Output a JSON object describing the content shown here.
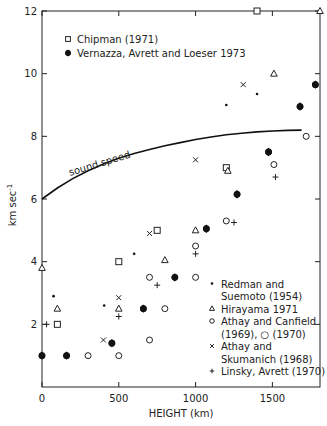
{
  "chart_data": {
    "type": "scatter",
    "title": "",
    "xlabel": "HEIGHT (km)",
    "ylabel": "km sec⁻¹",
    "xlim": [
      0,
      1810
    ],
    "ylim": [
      0,
      12
    ],
    "x_ticks": [
      0,
      500,
      1000,
      1500
    ],
    "y_ticks": [
      2,
      4,
      6,
      8,
      10,
      12
    ],
    "grid": false,
    "legend_position": "top-left and bottom-right (two groups)",
    "line_series": [
      {
        "name": "sound speed",
        "label": "sound speed",
        "points": [
          [
            0,
            6.0
          ],
          [
            100,
            6.35
          ],
          [
            200,
            6.65
          ],
          [
            300,
            6.9
          ],
          [
            400,
            7.12
          ],
          [
            500,
            7.3
          ],
          [
            600,
            7.45
          ],
          [
            700,
            7.58
          ],
          [
            800,
            7.7
          ],
          [
            900,
            7.8
          ],
          [
            1000,
            7.9
          ],
          [
            1100,
            7.98
          ],
          [
            1200,
            8.05
          ],
          [
            1300,
            8.1
          ],
          [
            1400,
            8.14
          ],
          [
            1500,
            8.17
          ],
          [
            1600,
            8.19
          ],
          [
            1690,
            8.2
          ]
        ]
      }
    ],
    "series": [
      {
        "name": "Chipman (1971)",
        "marker": "open-square",
        "points": [
          [
            100,
            2.0
          ],
          [
            500,
            4.0
          ],
          [
            750,
            5.0
          ],
          [
            1200,
            7.0
          ],
          [
            1400,
            12.0
          ]
        ]
      },
      {
        "name": "Vernazza, Avrett and Loeser 1973",
        "marker": "filled-diamond",
        "points": [
          [
            0,
            1.0
          ],
          [
            160,
            1.0
          ],
          [
            455,
            1.4
          ],
          [
            660,
            2.5
          ],
          [
            865,
            3.5
          ],
          [
            1070,
            5.05
          ],
          [
            1270,
            6.15
          ],
          [
            1475,
            7.5
          ],
          [
            1680,
            8.95
          ],
          [
            1780,
            9.65
          ]
        ]
      },
      {
        "name": "Redman and Suemoto (1954)",
        "marker": "small-dot",
        "points": [
          [
            75,
            2.9
          ],
          [
            405,
            2.6
          ],
          [
            600,
            4.25
          ],
          [
            1200,
            9.0
          ],
          [
            1400,
            9.35
          ]
        ]
      },
      {
        "name": "Hirayama 1971",
        "marker": "open-triangle",
        "points": [
          [
            0,
            3.8
          ],
          [
            100,
            2.5
          ],
          [
            500,
            2.5
          ],
          [
            800,
            4.05
          ],
          [
            1000,
            5.0
          ],
          [
            1210,
            6.9
          ],
          [
            1510,
            10.0
          ],
          [
            1810,
            12.0
          ]
        ]
      },
      {
        "name": "Athay and Canfield (1969), (1970)",
        "marker": "open-circle",
        "points": [
          [
            300,
            1.0
          ],
          [
            500,
            1.0
          ],
          [
            700,
            1.5
          ],
          [
            700,
            3.5
          ],
          [
            800,
            2.5
          ],
          [
            1000,
            3.5
          ],
          [
            1000,
            4.5
          ],
          [
            1200,
            5.3
          ],
          [
            1510,
            7.1
          ],
          [
            1720,
            8.0
          ]
        ]
      },
      {
        "name": "Athay and Skumanich (1968)",
        "marker": "x-cross",
        "points": [
          [
            400,
            1.5
          ],
          [
            500,
            2.85
          ],
          [
            700,
            4.9
          ],
          [
            1000,
            7.25
          ],
          [
            1310,
            9.65
          ]
        ]
      },
      {
        "name": "Linsky, Avrett (1970)",
        "marker": "plus",
        "points": [
          [
            30,
            2.0
          ],
          [
            500,
            2.25
          ],
          [
            750,
            3.25
          ],
          [
            1000,
            4.25
          ],
          [
            1250,
            5.25
          ],
          [
            1520,
            6.7
          ]
        ]
      }
    ],
    "annotations": [
      "sound speed"
    ]
  },
  "labels": {
    "x_axis": "HEIGHT (km)",
    "y_axis": "km sec",
    "y_axis_sup": "-1",
    "curve": "sound speed",
    "x_ticks": [
      "0",
      "500",
      "1000",
      "1500"
    ],
    "y_ticks": [
      "2",
      "4",
      "6",
      "8",
      "10",
      "12"
    ]
  },
  "legend_top": [
    {
      "marker": "open-square",
      "label": "Chipman (1971)"
    },
    {
      "marker": "filled-diamond",
      "label": "Vernazza, Avrett and Loeser 1973"
    }
  ],
  "legend_bottom": [
    {
      "marker": "small-dot",
      "lines": [
        "Redman and",
        "Suemoto (1954)"
      ]
    },
    {
      "marker": "open-triangle",
      "lines": [
        "Hirayama 1971"
      ]
    },
    {
      "marker": "open-circle",
      "lines": [
        "Athay and Canfield",
        "(1969), ○ (1970)"
      ]
    },
    {
      "marker": "x-cross",
      "lines": [
        "Athay and",
        "Skumanich (1968)"
      ]
    },
    {
      "marker": "plus",
      "lines": [
        "Linsky, Avrett (1970)"
      ]
    }
  ]
}
